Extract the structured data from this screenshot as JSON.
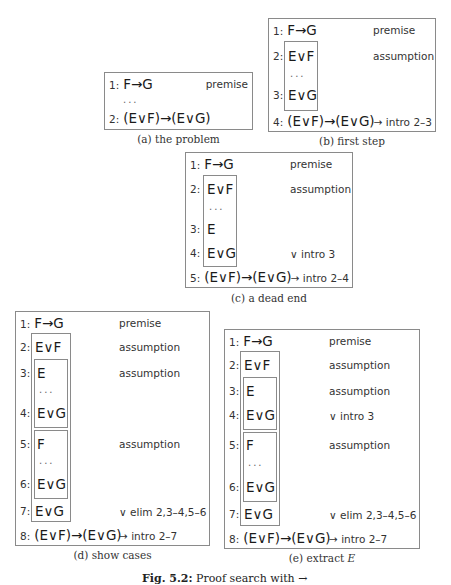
{
  "figure": {
    "caption_label": "Fig. 5.2:",
    "caption_text": "Proof search with →"
  },
  "panels": {
    "a": {
      "caption": "(a) the problem",
      "lines": [
        {
          "num": "1:",
          "formula": "F→G",
          "just": "premise"
        },
        {
          "num": "",
          "formula": "...",
          "just": ""
        },
        {
          "num": "2:",
          "formula": "(E∨F)→(E∨G)",
          "just": ""
        }
      ]
    },
    "b": {
      "caption": "(b) first step",
      "lines": [
        {
          "num": "1:",
          "formula": "F→G",
          "just": "premise"
        },
        {
          "num": "2:",
          "formula": "E∨F",
          "just": "assumption"
        },
        {
          "num": "",
          "formula": "...",
          "just": ""
        },
        {
          "num": "3:",
          "formula": "E∨G",
          "just": ""
        },
        {
          "num": "4:",
          "formula": "(E∨F)→(E∨G)",
          "just": "→ intro 2–3"
        }
      ]
    },
    "c": {
      "caption": "(c) a dead end",
      "lines": [
        {
          "num": "1:",
          "formula": "F→G",
          "just": "premise"
        },
        {
          "num": "2:",
          "formula": "E∨F",
          "just": "assumption"
        },
        {
          "num": "",
          "formula": "...",
          "just": ""
        },
        {
          "num": "3:",
          "formula": "E",
          "just": ""
        },
        {
          "num": "4:",
          "formula": "E∨G",
          "just": "∨ intro 3"
        },
        {
          "num": "5:",
          "formula": "(E∨F)→(E∨G)",
          "just": "→ intro 2–4"
        }
      ]
    },
    "d": {
      "caption": "(d) show cases",
      "lines": [
        {
          "num": "1:",
          "formula": "F→G",
          "just": "premise"
        },
        {
          "num": "2:",
          "formula": "E∨F",
          "just": "assumption"
        },
        {
          "num": "3:",
          "formula": "E",
          "just": "assumption"
        },
        {
          "num": "",
          "formula": "...",
          "just": ""
        },
        {
          "num": "4:",
          "formula": "E∨G",
          "just": ""
        },
        {
          "num": "5:",
          "formula": "F",
          "just": "assumption"
        },
        {
          "num": "",
          "formula": "...",
          "just": ""
        },
        {
          "num": "6:",
          "formula": "E∨G",
          "just": ""
        },
        {
          "num": "7:",
          "formula": "E∨G",
          "just": "∨ elim 2,3–4,5–6"
        },
        {
          "num": "8:",
          "formula": "(E∨F)→(E∨G)",
          "just": "→ intro 2–7"
        }
      ]
    },
    "e": {
      "caption_prefix": "(e) extract ",
      "caption_var": "E",
      "lines": [
        {
          "num": "1:",
          "formula": "F→G",
          "just": "premise"
        },
        {
          "num": "2:",
          "formula": "E∨F",
          "just": "assumption"
        },
        {
          "num": "3:",
          "formula": "E",
          "just": "assumption"
        },
        {
          "num": "4:",
          "formula": "E∨G",
          "just": "∨ intro 3"
        },
        {
          "num": "5:",
          "formula": "F",
          "just": "assumption"
        },
        {
          "num": "",
          "formula": "...",
          "just": ""
        },
        {
          "num": "6:",
          "formula": "E∨G",
          "just": ""
        },
        {
          "num": "7:",
          "formula": "E∨G",
          "just": "∨ elim 2,3–4,5–6"
        },
        {
          "num": "8:",
          "formula": "(E∨F)→(E∨G)",
          "just": "→ intro 2–7"
        }
      ]
    }
  }
}
